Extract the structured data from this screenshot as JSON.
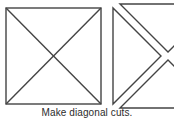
{
  "figure": {
    "caption": "Make diagonal cuts.",
    "stroke_color": "#444444",
    "background_color": "#ffffff",
    "stroke_width": 1.4,
    "panels": [
      {
        "name": "square-with-diagonals",
        "label": "square with both diagonals drawn",
        "square": {
          "x": 6,
          "y": 8,
          "width": 95,
          "height": 96
        },
        "diagonals": [
          {
            "x1": 6,
            "y1": 8,
            "x2": 101,
            "y2": 104
          },
          {
            "x1": 101,
            "y1": 8,
            "x2": 6,
            "y2": 104
          }
        ]
      },
      {
        "name": "separated-triangles",
        "label": "square cut apart into triangles along the diagonals",
        "pieces": [
          {
            "name": "left-triangle",
            "points": "113,8 113,104 161,56"
          },
          {
            "name": "top-triangle",
            "points": "120,4 216,4 168,52"
          },
          {
            "name": "bottom-triangle",
            "points": "168,60 216,108 120,108"
          }
        ]
      }
    ]
  }
}
